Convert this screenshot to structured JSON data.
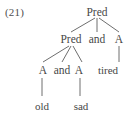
{
  "figure": {
    "example_label": "(21)",
    "type": "syntax-tree",
    "ink_color": "#474747",
    "line_color": "#6e6e6e",
    "background_color": "#ffffff"
  },
  "tree": {
    "root": {
      "id": "root",
      "label": "Pred",
      "x": 97,
      "y": 12
    },
    "level2": [
      {
        "id": "pred-2",
        "label": "Pred",
        "x": 71,
        "y": 39
      },
      {
        "id": "and-2",
        "label": "and",
        "x": 97,
        "y": 39
      },
      {
        "id": "a-2",
        "label": "A",
        "x": 119,
        "y": 39
      }
    ],
    "level3": [
      {
        "id": "a-3-left",
        "label": "A",
        "x": 43,
        "y": 70
      },
      {
        "id": "and-3",
        "label": "and",
        "x": 62,
        "y": 70
      },
      {
        "id": "a-3-right",
        "label": "A",
        "x": 79,
        "y": 70
      },
      {
        "id": "tired",
        "label": "tired",
        "x": 108,
        "y": 70
      }
    ],
    "level4": [
      {
        "id": "old",
        "label": "old",
        "x": 42,
        "y": 106
      },
      {
        "id": "sad",
        "label": "sad",
        "x": 81,
        "y": 106
      }
    ],
    "edges": [
      {
        "from": "root",
        "to": "pred-2",
        "x1": 95,
        "y1": 18,
        "x2": 71,
        "y2": 32
      },
      {
        "from": "root",
        "to": "and-2",
        "x1": 97,
        "y1": 18,
        "x2": 97,
        "y2": 32
      },
      {
        "from": "root",
        "to": "a-2",
        "x1": 99,
        "y1": 18,
        "x2": 119,
        "y2": 32
      },
      {
        "from": "pred-2",
        "to": "a-3-left",
        "x1": 69,
        "y1": 46,
        "x2": 43,
        "y2": 62
      },
      {
        "from": "pred-2",
        "to": "and-3",
        "x1": 71,
        "y1": 46,
        "x2": 62,
        "y2": 62
      },
      {
        "from": "pred-2",
        "to": "a-3-right",
        "x1": 73,
        "y1": 46,
        "x2": 82,
        "y2": 62
      },
      {
        "from": "a-2",
        "to": "tired",
        "x1": 119,
        "y1": 46,
        "x2": 119,
        "y2": 62
      },
      {
        "from": "a-3-left",
        "to": "old",
        "x1": 42,
        "y1": 78,
        "x2": 42,
        "y2": 96
      },
      {
        "from": "a-3-right",
        "to": "sad",
        "x1": 80,
        "y1": 78,
        "x2": 80,
        "y2": 96
      }
    ]
  }
}
